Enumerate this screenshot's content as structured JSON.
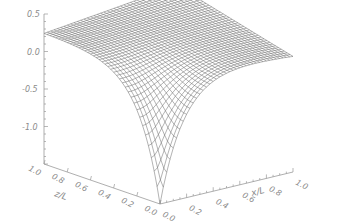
{
  "chart_data": {
    "type": "surface",
    "title": "",
    "x": {
      "label": "x/L",
      "ticks": [
        "0.0",
        "0.2",
        "0.4",
        "0.6",
        "0.8",
        "1.0"
      ],
      "range": [
        0.0,
        1.0
      ]
    },
    "y": {
      "label": "z/L",
      "ticks": [
        "0.0",
        "0.2",
        "0.4",
        "0.6",
        "0.8",
        "1.0"
      ],
      "range": [
        0.0,
        1.0
      ]
    },
    "z": {
      "label": "",
      "ticks": [
        "0.5",
        "0.0",
        "-0.5",
        "-1.0",
        "-1.5"
      ],
      "range": [
        -1.5,
        0.5
      ]
    },
    "grid_resolution": 40,
    "surface_description": "Wire-mesh surface near 0.25 at the far corners, sloping down to a sharp cusp minimum (~ -1.5) at x/L=0, z/L=0",
    "corner_values": {
      "x0_z1": 0.25,
      "x1_z1": 0.45,
      "x1_z0": 0.05,
      "x0_z0": -1.5
    },
    "mesh_color": "#555555",
    "axis_color": "#9a9a9a",
    "background": "#ffffff"
  },
  "labels": {
    "z_ticks": [
      "0.5",
      "0.0",
      "-0.5",
      "-1.0",
      "-1.5"
    ],
    "y_ticks": [
      "1.0",
      "0.8",
      "0.6",
      "0.4",
      "0.2",
      "0.0"
    ],
    "x_ticks": [
      "0.0",
      "0.2",
      "0.4",
      "0.6",
      "0.8",
      "1.0"
    ],
    "x_title": "x/L",
    "y_title": "z/L"
  }
}
